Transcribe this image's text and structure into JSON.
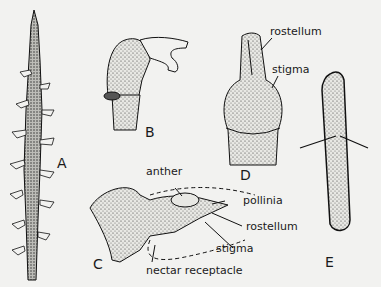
{
  "figure": {
    "panels": [
      {
        "id": "A",
        "label": "A"
      },
      {
        "id": "B",
        "label": "B"
      },
      {
        "id": "C",
        "label": "C"
      },
      {
        "id": "D",
        "label": "D"
      },
      {
        "id": "E",
        "label": "E"
      }
    ],
    "annotations": {
      "d_rostellum": "rostellum",
      "d_stigma": "stigma",
      "c_anther": "anther",
      "c_pollinia": "pollinia",
      "c_rostellum": "rostellum",
      "c_stigma": "stigma",
      "c_nectar": "nectar receptacle"
    }
  }
}
